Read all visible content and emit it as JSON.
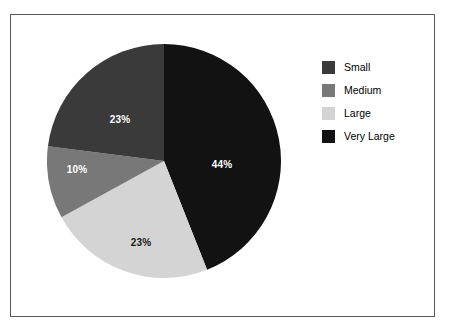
{
  "frame": {
    "border_color": "#58595b",
    "background": "#ffffff"
  },
  "legend": {
    "position": "right",
    "items": [
      {
        "label": "Small",
        "color": "#3a3a3a"
      },
      {
        "label": "Medium",
        "color": "#787878"
      },
      {
        "label": "Large",
        "color": "#d4d4d4"
      },
      {
        "label": "Very Large",
        "color": "#121212"
      }
    ]
  },
  "chart_data": {
    "type": "pie",
    "title": "",
    "xlabel": "",
    "ylabel": "",
    "legend_position": "right",
    "grid": false,
    "start_angle_deg": 90,
    "direction": "clockwise",
    "categories": [
      "Small",
      "Medium",
      "Large",
      "Very Large"
    ],
    "values": [
      23,
      10,
      23,
      44
    ],
    "value_unit": "%",
    "colors": [
      "#3a3a3a",
      "#787878",
      "#d4d4d4",
      "#121212"
    ],
    "slices": [
      {
        "name": "Very Large",
        "value": 44,
        "label": "44%",
        "color": "#121212",
        "label_color": "light"
      },
      {
        "name": "Large",
        "value": 23,
        "label": "23%",
        "color": "#d4d4d4",
        "label_color": "dark"
      },
      {
        "name": "Medium",
        "value": 10,
        "label": "10%",
        "color": "#787878",
        "label_color": "light"
      },
      {
        "name": "Small",
        "value": 23,
        "label": "23%",
        "color": "#3a3a3a",
        "label_color": "light"
      }
    ]
  }
}
